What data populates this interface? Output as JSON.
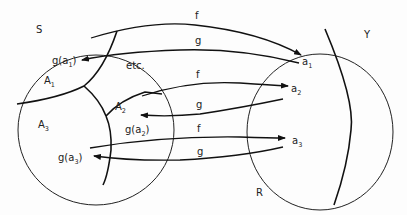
{
  "diagram": {
    "sets": {
      "S": "S",
      "Y": "Y",
      "R": "R"
    },
    "regions": {
      "A1": {
        "base": "A",
        "sub": "1"
      },
      "A2": {
        "base": "A",
        "sub": "2"
      },
      "A3": {
        "base": "A",
        "sub": "3"
      },
      "etc": "etc."
    },
    "points": {
      "a1": {
        "base": "a",
        "sub": "1"
      },
      "a2": {
        "base": "a",
        "sub": "2"
      },
      "a3": {
        "base": "a",
        "sub": "3"
      }
    },
    "images": {
      "g_a1": {
        "pre": "g(a",
        "sub": "1",
        "post": ")"
      },
      "g_a2": {
        "pre": "g(a",
        "sub": "2",
        "post": ")"
      },
      "g_a3": {
        "pre": "g(a",
        "sub": "3",
        "post": ")"
      }
    },
    "maps": {
      "f1": "f",
      "g1": "g",
      "f2": "f",
      "g2": "g",
      "f3": "f",
      "g3": "g"
    },
    "colors": {
      "ink": "#222222",
      "background": "#fdfdfd"
    }
  }
}
